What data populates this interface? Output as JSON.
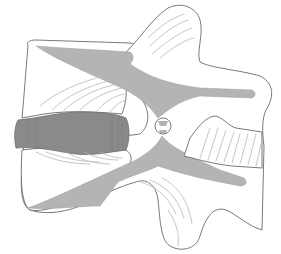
{
  "figure": {
    "alt": "Line drawing of two adjacent vertebrae with a dark gray intervertebral disc and light gray ligaments",
    "colors": {
      "background": "#ffffff",
      "outline": "#6a6a6a",
      "ligament_fill": "#b4b4b4",
      "disc_fill": "#8a8a8a",
      "hatch_lines": "#b8b8b8"
    },
    "parts": [
      {
        "id": "upper-vertebral-body",
        "label": "Upper vertebral body"
      },
      {
        "id": "lower-vertebral-body",
        "label": "Lower vertebral body"
      },
      {
        "id": "intervertebral-disc",
        "label": "Intervertebral disc"
      },
      {
        "id": "spinous-process",
        "label": "Spinous process"
      },
      {
        "id": "transverse-process",
        "label": "Transverse process"
      },
      {
        "id": "ligaments",
        "label": "Ligaments"
      },
      {
        "id": "facet-joint",
        "label": "Facet joint"
      }
    ]
  }
}
